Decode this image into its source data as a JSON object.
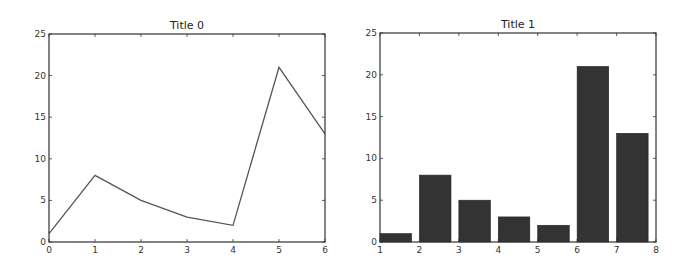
{
  "chart_data": [
    {
      "type": "line",
      "title": "Title 0",
      "xlabel": "",
      "ylabel": "",
      "x": [
        0,
        1,
        2,
        3,
        4,
        5,
        6
      ],
      "values": [
        1,
        8,
        5,
        3,
        2,
        21,
        13
      ],
      "xlim": [
        0,
        6
      ],
      "ylim": [
        0,
        25
      ],
      "xticks": [
        "0",
        "1",
        "2",
        "3",
        "4",
        "5",
        "6"
      ],
      "yticks": [
        "0",
        "5",
        "10",
        "15",
        "20",
        "25"
      ],
      "grid": false,
      "color": "#555555"
    },
    {
      "type": "bar",
      "title": "Title 1",
      "xlabel": "",
      "ylabel": "",
      "x": [
        1,
        2,
        3,
        4,
        5,
        6,
        7
      ],
      "values": [
        1,
        8,
        5,
        3,
        2,
        21,
        13
      ],
      "bar_width": 0.8,
      "xlim": [
        1,
        8
      ],
      "ylim": [
        0,
        25
      ],
      "xticks": [
        "1",
        "2",
        "3",
        "4",
        "5",
        "6",
        "7",
        "8"
      ],
      "yticks": [
        "0",
        "5",
        "10",
        "15",
        "20",
        "25"
      ],
      "grid": false,
      "color": "#333333"
    }
  ]
}
